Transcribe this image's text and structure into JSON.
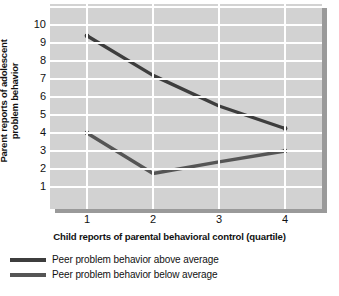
{
  "chart_data": {
    "type": "line",
    "title": "",
    "xlabel": "Child reports of parental behavioral control (quartile)",
    "ylabel": "Parent reports of adolescent problem behavior",
    "ylabel_line1": "Parent reports of adolescent",
    "ylabel_line2": "problem behavior",
    "x": [
      1,
      2,
      3,
      4
    ],
    "xticklabels": [
      "1",
      "2",
      "3",
      "4"
    ],
    "yticklabels": [
      "10",
      "9",
      "8",
      "7",
      "6",
      "5",
      "4",
      "3",
      "2",
      "1"
    ],
    "xlim": [
      0.5,
      4.5
    ],
    "ylim": [
      0,
      10.6
    ],
    "grid": "both",
    "legend_position": "below",
    "series": [
      {
        "name": "Peer problem behavior above average",
        "values": [
          9.4,
          7.2,
          5.5,
          4.25
        ],
        "color": "#3d3d3d"
      },
      {
        "name": "Peer problem behavior below average",
        "values": [
          4.0,
          1.75,
          2.4,
          3.0
        ],
        "color": "#555555"
      }
    ]
  },
  "legend": {
    "items": [
      {
        "label": "Peer problem behavior above average"
      },
      {
        "label": "Peer problem behavior below average"
      }
    ]
  },
  "style": {
    "plot_background": "#d2d2d2",
    "gridline_color": "#ffffff",
    "shadow_color": "#9a9a9a",
    "text_color": "#111111"
  }
}
